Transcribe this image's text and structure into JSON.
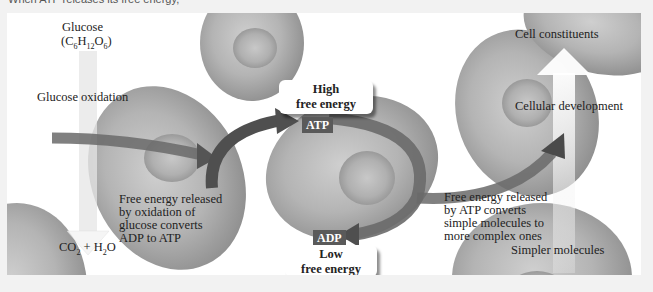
{
  "header": {
    "text": "When ATP releases its free energy,"
  },
  "left": {
    "glucose": "Glucose",
    "glucose_formula": {
      "C": "C",
      "c_sub": "6",
      "H": "H",
      "h_sub": "12",
      "O": "O",
      "o_sub": "6"
    },
    "oxidation": "Glucose oxidation",
    "released_lines": [
      "Free energy released",
      "by oxidation of",
      "glucose converts",
      "ADP to ATP"
    ],
    "products": {
      "co": "CO",
      "co_sub": "2",
      "plus": " + H",
      "h_sub": "2",
      "o": "O"
    }
  },
  "center": {
    "high_box": [
      "High",
      "free energy"
    ],
    "atp_tag": "ATP",
    "adp_tag": "ADP",
    "low_box": [
      "Low",
      "free energy"
    ]
  },
  "right": {
    "constituents": "Cell constituents",
    "development": "Cellular development",
    "released_lines": [
      "Free energy released",
      "by ATP converts",
      "simple molecules to",
      "more complex ones"
    ],
    "simpler": "Simpler molecules"
  },
  "colors": {
    "arrow_dark": "#4a4a4a",
    "arrow_mid": "#8a8a8a",
    "cell": "#a8a8a8",
    "tag_bg": "#5a5a5a",
    "panel_bg": "#ffffff",
    "page_bg": "#f2f2f2"
  }
}
